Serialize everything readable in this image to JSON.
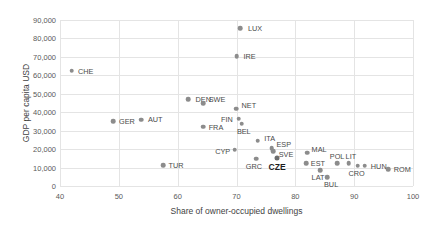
{
  "chart_data": {
    "type": "scatter",
    "title": "",
    "xlabel": "Share of owner-occupied dwellings",
    "ylabel": "GDP per capita USD",
    "xlim": [
      40,
      100
    ],
    "ylim": [
      0,
      90000
    ],
    "xticks": [
      "40",
      "50",
      "60",
      "70",
      "80",
      "90",
      "100"
    ],
    "xtick_values": [
      40,
      50,
      60,
      70,
      80,
      90,
      100
    ],
    "yticks": [
      "0",
      "10,000",
      "20,000",
      "30,000",
      "40,000",
      "50,000",
      "60,000",
      "70,000",
      "80,000",
      "90,000"
    ],
    "ytick_values": [
      0,
      10000,
      20000,
      30000,
      40000,
      50000,
      60000,
      70000,
      80000,
      90000
    ],
    "grid": true,
    "legend": "none",
    "marker_color": "#8c8c8c",
    "highlight_color": "#1d1d1d",
    "points": [
      {
        "label": "CHE",
        "x": 42.0,
        "y": 62500,
        "lx": 14,
        "ly": 0
      },
      {
        "label": "LUX",
        "x": 70.6,
        "y": 85700,
        "lx": 15,
        "ly": 0
      },
      {
        "label": "IRE",
        "x": 70.0,
        "y": 70400,
        "lx": 13,
        "ly": 0
      },
      {
        "label": "DEN",
        "x": 61.8,
        "y": 47000,
        "lx": 15,
        "ly": 0
      },
      {
        "label": "SWE",
        "x": 64.3,
        "y": 44800,
        "lx": 14,
        "ly": -4
      },
      {
        "label": "NET",
        "x": 69.9,
        "y": 42000,
        "lx": 13,
        "ly": -4
      },
      {
        "label": "GER",
        "x": 49.0,
        "y": 35000,
        "lx": 14,
        "ly": 0
      },
      {
        "label": "AUT",
        "x": 53.8,
        "y": 36000,
        "lx": 14,
        "ly": -1
      },
      {
        "label": "FIN",
        "x": 70.4,
        "y": 36500,
        "lx": -12,
        "ly": 0
      },
      {
        "label": "BEL",
        "x": 70.9,
        "y": 33800,
        "lx": 2,
        "ly": 7
      },
      {
        "label": "FRA",
        "x": 64.3,
        "y": 32200,
        "lx": 13,
        "ly": 0
      },
      {
        "label": "ITA",
        "x": 73.6,
        "y": 24500,
        "lx": 12,
        "ly": -3
      },
      {
        "label": "ESP",
        "x": 76.0,
        "y": 20600,
        "lx": 12,
        "ly": -4
      },
      {
        "label": "SVE",
        "x": 76.2,
        "y": 19000,
        "lx": 13,
        "ly": 3
      },
      {
        "label": "CYP",
        "x": 69.7,
        "y": 19600,
        "lx": -12,
        "ly": 1
      },
      {
        "label": "CZE",
        "x": 76.9,
        "y": 15200,
        "lx": 0,
        "ly": 9,
        "highlight": true
      },
      {
        "label": "GRC",
        "x": 73.3,
        "y": 14700,
        "lx": -2,
        "ly": 7
      },
      {
        "label": "MAL",
        "x": 82.0,
        "y": 18000,
        "lx": 12,
        "ly": -4
      },
      {
        "label": "EST",
        "x": 81.8,
        "y": 12500,
        "lx": 12,
        "ly": 0
      },
      {
        "label": "TUR",
        "x": 57.5,
        "y": 11400,
        "lx": 13,
        "ly": 0
      },
      {
        "label": "POL",
        "x": 87.1,
        "y": 12500,
        "lx": 0,
        "ly": -7
      },
      {
        "label": "LIT",
        "x": 89.1,
        "y": 12500,
        "lx": 2,
        "ly": -7
      },
      {
        "label": "LAT",
        "x": 84.2,
        "y": 8700,
        "lx": -2,
        "ly": 7
      },
      {
        "label": "CRO",
        "x": 90.6,
        "y": 10900,
        "lx": -1,
        "ly": 7
      },
      {
        "label": "HUN",
        "x": 91.8,
        "y": 10900,
        "lx": 14,
        "ly": 0
      },
      {
        "label": "BUL",
        "x": 85.4,
        "y": 4900,
        "lx": 4,
        "ly": 7
      },
      {
        "label": "ROM",
        "x": 95.8,
        "y": 9200,
        "lx": 14,
        "ly": 0
      }
    ]
  }
}
